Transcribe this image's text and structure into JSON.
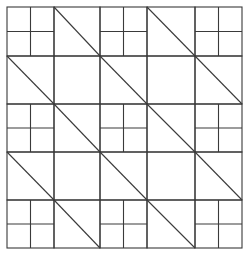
{
  "diagram": {
    "type": "quilt-block-pattern",
    "grid": {
      "cols": 5,
      "rows": 5
    },
    "x_lines": [
      7,
      54,
      100,
      147,
      195,
      242
    ],
    "y_lines": [
      7,
      56,
      104,
      152,
      200,
      248
    ],
    "line_color": "#3a3a3a",
    "background": "#ffffff",
    "cell_types": [
      [
        "four-patch",
        "diagonal",
        "four-patch",
        "diagonal",
        "four-patch"
      ],
      [
        "diagonal",
        "plain",
        "diagonal",
        "plain",
        "diagonal"
      ],
      [
        "four-patch",
        "diagonal",
        "four-patch",
        "diagonal",
        "four-patch"
      ],
      [
        "diagonal",
        "plain",
        "diagonal",
        "plain",
        "diagonal"
      ],
      [
        "four-patch",
        "diagonal",
        "four-patch",
        "diagonal",
        "four-patch"
      ]
    ],
    "diagonal_direction": "top-left-to-bottom-right"
  }
}
